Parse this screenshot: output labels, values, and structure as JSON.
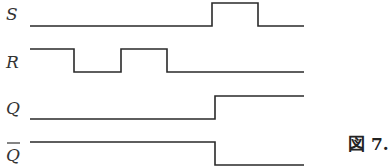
{
  "diagram": {
    "type": "timing-diagram",
    "signals": [
      {
        "name": "S",
        "label": "S",
        "overline": false,
        "levels": [
          {
            "x0": 30,
            "x1": 212,
            "level": "low"
          },
          {
            "x0": 212,
            "x1": 258,
            "level": "high"
          },
          {
            "x0": 258,
            "x1": 304,
            "level": "low"
          }
        ]
      },
      {
        "name": "R",
        "label": "R",
        "overline": false,
        "levels": [
          {
            "x0": 30,
            "x1": 74,
            "level": "high"
          },
          {
            "x0": 74,
            "x1": 121,
            "level": "low"
          },
          {
            "x0": 121,
            "x1": 167,
            "level": "high"
          },
          {
            "x0": 167,
            "x1": 304,
            "level": "low"
          }
        ]
      },
      {
        "name": "Q",
        "label": "Q",
        "overline": false,
        "levels": [
          {
            "x0": 30,
            "x1": 215,
            "level": "low"
          },
          {
            "x0": 215,
            "x1": 304,
            "level": "high"
          }
        ]
      },
      {
        "name": "Q-bar",
        "label": "Q",
        "overline": true,
        "levels": [
          {
            "x0": 30,
            "x1": 215,
            "level": "high"
          },
          {
            "x0": 215,
            "x1": 304,
            "level": "low"
          }
        ]
      }
    ],
    "caption": "図 7."
  }
}
